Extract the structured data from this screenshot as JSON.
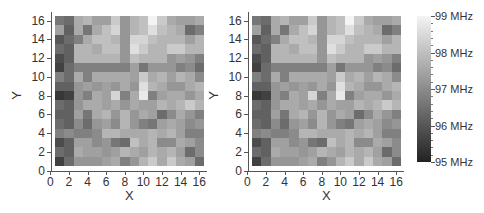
{
  "chart_data": [
    {
      "type": "heatmap",
      "title": "",
      "xlabel": "X",
      "ylabel": "Y",
      "xlim": [
        0,
        16.5
      ],
      "ylim": [
        0,
        16.5
      ],
      "x_ticks": [
        "0",
        "2",
        "4",
        "6",
        "8",
        "10",
        "12",
        "14",
        "16"
      ],
      "y_ticks": [
        "0",
        "2",
        "4",
        "6",
        "8",
        "10",
        "12",
        "14",
        "16"
      ],
      "x": [
        1,
        2,
        3,
        4,
        5,
        6,
        7,
        8,
        9,
        10,
        11,
        12,
        13,
        14,
        15,
        16
      ],
      "y_rows_top_to_bottom": [
        16,
        15,
        14,
        13,
        12,
        11,
        10,
        9,
        8,
        7,
        6,
        5,
        4,
        3,
        2,
        1
      ],
      "z_unit": "MHz",
      "z": [
        [
          96.6,
          96.4,
          97.6,
          97.8,
          97.4,
          97.4,
          98.2,
          97.2,
          97.8,
          98.0,
          99.0,
          98.2,
          97.6,
          97.4,
          97.4,
          97.6
        ],
        [
          97.4,
          96.2,
          97.6,
          96.6,
          97.6,
          98.0,
          98.4,
          97.2,
          97.8,
          98.0,
          98.6,
          98.0,
          97.8,
          97.6,
          96.4,
          96.8
        ],
        [
          96.0,
          96.4,
          96.8,
          97.6,
          98.0,
          98.0,
          97.8,
          97.2,
          98.4,
          98.4,
          98.0,
          97.8,
          97.8,
          97.8,
          97.4,
          97.8
        ],
        [
          96.4,
          96.2,
          97.8,
          97.8,
          97.6,
          98.0,
          98.0,
          97.2,
          98.6,
          98.2,
          97.8,
          97.8,
          98.2,
          98.2,
          97.8,
          97.8
        ],
        [
          95.8,
          96.2,
          97.8,
          97.8,
          97.8,
          97.8,
          97.8,
          97.2,
          98.0,
          97.8,
          97.8,
          97.8,
          97.2,
          97.4,
          97.2,
          96.8
        ],
        [
          95.6,
          96.4,
          96.8,
          96.8,
          96.8,
          96.8,
          96.8,
          96.8,
          97.4,
          96.6,
          97.2,
          97.2,
          97.2,
          96.8,
          97.0,
          96.4
        ],
        [
          96.8,
          96.4,
          97.6,
          96.8,
          97.6,
          97.6,
          97.6,
          97.6,
          97.4,
          98.2,
          97.6,
          97.8,
          97.4,
          97.8,
          97.6,
          97.0
        ],
        [
          96.2,
          96.2,
          97.2,
          97.4,
          97.2,
          97.4,
          97.2,
          97.6,
          97.2,
          98.6,
          97.8,
          97.6,
          97.2,
          97.2,
          97.6,
          97.8
        ],
        [
          95.4,
          95.6,
          97.2,
          96.8,
          97.6,
          97.4,
          98.4,
          96.8,
          97.6,
          98.8,
          96.8,
          97.4,
          97.6,
          97.6,
          97.2,
          97.6
        ],
        [
          96.4,
          96.2,
          97.2,
          97.6,
          97.6,
          97.4,
          97.6,
          97.2,
          97.6,
          97.4,
          97.4,
          97.8,
          97.6,
          97.8,
          98.2,
          97.8
        ],
        [
          96.2,
          96.2,
          97.4,
          96.6,
          97.6,
          97.8,
          97.2,
          97.8,
          97.2,
          97.6,
          97.4,
          96.4,
          97.0,
          97.6,
          97.2,
          96.8
        ],
        [
          96.4,
          96.2,
          97.0,
          96.4,
          97.2,
          97.4,
          97.0,
          97.8,
          97.2,
          96.8,
          96.6,
          97.4,
          97.6,
          97.4,
          97.0,
          97.2
        ],
        [
          96.8,
          97.0,
          96.8,
          96.8,
          97.0,
          97.8,
          97.8,
          97.6,
          97.6,
          97.6,
          97.8,
          97.6,
          97.8,
          97.4,
          96.8,
          96.8
        ],
        [
          95.8,
          96.2,
          97.4,
          97.4,
          97.0,
          97.2,
          96.6,
          96.4,
          98.0,
          97.6,
          97.8,
          97.0,
          97.0,
          97.6,
          97.4,
          97.0
        ],
        [
          96.4,
          96.2,
          97.6,
          97.4,
          97.4,
          97.2,
          97.4,
          97.8,
          97.6,
          97.4,
          97.8,
          97.6,
          97.8,
          97.4,
          96.4,
          97.0
        ],
        [
          95.6,
          96.4,
          97.2,
          97.2,
          97.2,
          97.4,
          97.6,
          96.8,
          97.2,
          97.8,
          98.2,
          97.6,
          98.2,
          97.6,
          97.4,
          96.4
        ]
      ],
      "colorbar": {
        "min": 95,
        "max": 99,
        "colormap": "grayscale (dark=low, light=high)",
        "tick_labels": [
          "99 MHz",
          "98 MHz",
          "97 MHz",
          "96 MHz",
          "95 MHz"
        ]
      },
      "grid": false
    },
    {
      "type": "heatmap",
      "note_same_as_left": true,
      "xlabel": "X",
      "ylabel": "Y",
      "x_ticks": [
        "0",
        "2",
        "4",
        "6",
        "8",
        "10",
        "12",
        "14",
        "16"
      ],
      "y_ticks": [
        "0",
        "2",
        "4",
        "6",
        "8",
        "10",
        "12",
        "14",
        "16"
      ]
    }
  ],
  "axes": {
    "xlabel": "X",
    "ylabel": "Y",
    "x_ticks": [
      "0",
      "2",
      "4",
      "6",
      "8",
      "10",
      "12",
      "14",
      "16"
    ],
    "y_ticks": [
      "0",
      "2",
      "4",
      "6",
      "8",
      "10",
      "12",
      "14",
      "16"
    ]
  },
  "colorbar": {
    "labels": [
      "99 MHz",
      "98 MHz",
      "97 MHz",
      "96 MHz",
      "95 MHz"
    ],
    "min": 95,
    "max": 99,
    "light_color": "#f4f4f4",
    "dark_color": "#222222"
  }
}
